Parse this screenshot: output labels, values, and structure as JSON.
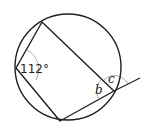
{
  "diagram": {
    "type": "cyclic-quadrilateral",
    "circle": {
      "cx": 68,
      "cy": 67,
      "r": 53
    },
    "vertices": {
      "top": [
        42,
        22
      ],
      "left": [
        16,
        68
      ],
      "bottom": [
        60,
        121
      ],
      "right": [
        114,
        91
      ]
    },
    "extension_end": [
      140,
      78
    ],
    "labels": {
      "angle_left": "112°",
      "angle_b": "b",
      "angle_c": "c"
    },
    "colors": {
      "stroke": "#231f20",
      "arc": "#a7a9ac"
    }
  }
}
